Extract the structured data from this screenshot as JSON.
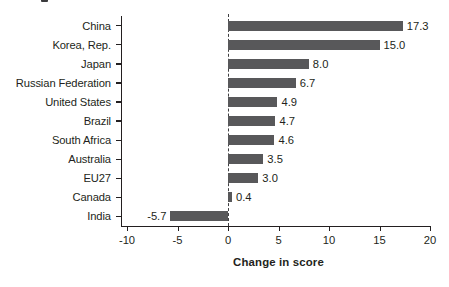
{
  "chart_data": {
    "type": "bar",
    "orientation": "horizontal",
    "title": "",
    "xlabel": "Change in score",
    "ylabel": "",
    "xlim": [
      -10,
      20
    ],
    "xticks": [
      -10,
      -5,
      0,
      5,
      10,
      15,
      20
    ],
    "xtick_labels": [
      "-10",
      "-5",
      "0",
      "5",
      "10",
      "15",
      "20"
    ],
    "grid": false,
    "legend": null,
    "zero_reference_line": true,
    "bar_color": "#58585a",
    "text_color": "#231f20",
    "categories": [
      "China",
      "Korea, Rep.",
      "Japan",
      "Russian Federation",
      "United States",
      "Brazil",
      "South Africa",
      "Australia",
      "EU27",
      "Canada",
      "India"
    ],
    "values": [
      17.3,
      15.0,
      8.0,
      6.7,
      4.9,
      4.7,
      4.6,
      3.5,
      3.0,
      0.4,
      -5.7
    ],
    "value_labels": [
      "17.3",
      "15.0",
      "8.0",
      "6.7",
      "4.9",
      "4.7",
      "4.6",
      "3.5",
      "3.0",
      "0.4",
      "-5.7"
    ]
  }
}
